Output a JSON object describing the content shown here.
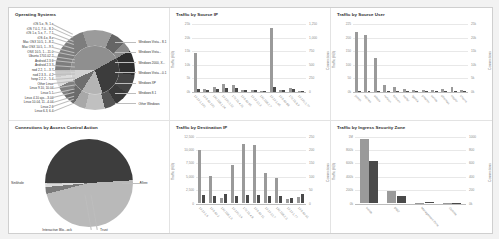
{
  "panels": {
    "operating_systems": {
      "title": "Operating Systems"
    },
    "traffic_source_ip": {
      "title": "Traffic by Source IP"
    },
    "traffic_source_user": {
      "title": "Traffic by Source User"
    },
    "connections_access_control": {
      "title": "Connections by Access Control Action"
    },
    "traffic_destination_ip": {
      "title": "Traffic by Destination IP"
    },
    "traffic_ingress_zone": {
      "title": "Traffic by Ingress Security Zone"
    }
  },
  "chart_data": [
    {
      "id": "operating_systems",
      "type": "pie",
      "title": "Operating Systems",
      "layout": "sunburst-two-ring",
      "legend": "callout-labels",
      "left_labels": [
        "iOS 5.x, 9i, 1.x",
        "iOS 7.0.1, 7.0... 8.1",
        "iOS 1.x, 5.x, 7... 7.1",
        "iOS 4.x, 8.x",
        "Mac OSX 10.5, 1...8.2",
        "Mac OSX 10.5, 1....9.5",
        "OSX 10.5, 1....11.0",
        "Ubuntu 1701.02.2",
        "Android 2.3.6",
        "Android 2.3.3",
        "nod 2.2, 1....3.7",
        "nod 2.3.3... 4.2",
        "hosp 2.2.2... 5.4",
        "Other Linux",
        "Linux 9.10, 10.04",
        "Linux 5.1",
        "Linux 4.10 ajo....3.04",
        "Linux 10.04, 11...4.04",
        "Linux 2.6",
        "Linux 6.3, 6.4"
      ],
      "right_labels": [
        "Windows Vista... 8.1",
        "Windows Vista...",
        "Windows 2000, X...",
        "Windows Vista....0.1",
        "Windows XP",
        "Windows 8.1",
        "Other Windows"
      ],
      "inner_ring": [
        {
          "name": "Windows",
          "value": 42,
          "color": "#8f8f8f"
        },
        {
          "name": "Linux",
          "value": 28,
          "color": "#3c3c3c"
        },
        {
          "name": "Mac OSX",
          "value": 14,
          "color": "#b4b4b4"
        },
        {
          "name": "Android",
          "value": 9,
          "color": "#6e6e6e"
        },
        {
          "name": "iOS",
          "value": 7,
          "color": "#d2d2d2"
        }
      ],
      "outer_ring": [
        {
          "name": "Windows Vista",
          "value": 20,
          "color": "#7d7d7d"
        },
        {
          "name": "Windows 7",
          "value": 12,
          "color": "#9b9b9b"
        },
        {
          "name": "Windows 2000",
          "value": 6,
          "color": "#656565"
        },
        {
          "name": "Windows XP",
          "value": 4,
          "color": "#8a8a8a"
        },
        {
          "name": "Linux 2.6",
          "value": 10,
          "color": "#2e2e2e"
        },
        {
          "name": "Linux 10.04",
          "value": 8,
          "color": "#444444"
        },
        {
          "name": "Linux 5.1",
          "value": 6,
          "color": "#3a3a3a"
        },
        {
          "name": "Other Linux",
          "value": 5,
          "color": "#555555"
        },
        {
          "name": "Mac OSX 10.5",
          "value": 8,
          "color": "#c0c0c0"
        },
        {
          "name": "Mac OSX 10.9",
          "value": 5,
          "color": "#a8a8a8"
        },
        {
          "name": "Android 2.3.3",
          "value": 5,
          "color": "#6b6b6b"
        },
        {
          "name": "Android 2.3.6",
          "value": 4,
          "color": "#808080"
        },
        {
          "name": "iOS 7.0.1",
          "value": 4,
          "color": "#dcdcdc"
        },
        {
          "name": "iOS 8.x",
          "value": 3,
          "color": "#cacaca"
        }
      ]
    },
    {
      "id": "traffic_source_ip",
      "type": "bar",
      "title": "Traffic by Source IP",
      "ylabel": "Traffic (KB)",
      "y2label": "Connections",
      "yticks": [
        "25k",
        "20k",
        "15k",
        "10k",
        "5k",
        "0k"
      ],
      "y2ticks": [
        "1,250",
        "1,000",
        "750",
        "500",
        "250",
        "0"
      ],
      "ylim": [
        0,
        25000
      ],
      "y2lim": [
        0,
        1250
      ],
      "grid": true,
      "categories": [
        "10.10.1.100",
        "10.5.60.100",
        "192.168.1.24",
        "10.100.0.12",
        "172.16.4.21",
        "10.5.60.55",
        "10.10.10.3",
        "192.168.2.7",
        "10.10.1.45",
        "10.5.60.88",
        "172.16.8.9",
        "10.100.0.77"
      ],
      "series": [
        {
          "name": "Traffic (KB)",
          "values": [
            14200,
            1100,
            1500,
            2600,
            2400,
            400,
            500,
            350,
            23500,
            600,
            1200,
            300
          ]
        },
        {
          "name": "Connections",
          "values": [
            40,
            30,
            55,
            70,
            60,
            20,
            25,
            18,
            90,
            25,
            45,
            15
          ]
        }
      ]
    },
    {
      "id": "traffic_source_user",
      "type": "bar",
      "title": "Traffic by Source User",
      "ylabel": "Traffic (KB)",
      "y2label": "Connections",
      "yticks": [
        "225",
        "200",
        "150",
        "100",
        "50",
        "0k"
      ],
      "y2ticks": [
        "25k",
        "20k",
        "15k",
        "10k",
        "5k",
        "0k"
      ],
      "ylim": [
        0,
        225
      ],
      "y2lim": [
        0,
        25000
      ],
      "grid": true,
      "categories": [
        "jsmith",
        "mjones",
        "adavis",
        "rwilson",
        "kbrown",
        "tmiller",
        "lgarcia",
        "pmartin",
        "swhite",
        "dthomas",
        "ctaylor",
        "bharris"
      ],
      "series": [
        {
          "name": "Traffic (KB)",
          "values": [
            196,
            188,
            112,
            22,
            16,
            8,
            6,
            6,
            6,
            8,
            14,
            6
          ]
        },
        {
          "name": "Connections",
          "values": [
            185,
            180,
            100,
            18,
            12,
            6,
            5,
            5,
            5,
            6,
            12,
            5
          ]
        }
      ]
    },
    {
      "id": "connections_access_control",
      "type": "pie",
      "title": "Connections by Access Control Action",
      "labels": [
        "Allow",
        "Sinkhole",
        "Interactive Blo...ock",
        "Trust"
      ],
      "slices": [
        {
          "name": "Allow",
          "value": 49.0,
          "color": "#3d3d3d"
        },
        {
          "name": "Sinkhole",
          "value": 47.0,
          "color": "#b9b9b9"
        },
        {
          "name": "Interactive Block",
          "value": 2.5,
          "color": "#7a7a7a"
        },
        {
          "name": "Trust",
          "value": 1.5,
          "color": "#dadada"
        }
      ]
    },
    {
      "id": "traffic_destination_ip",
      "type": "bar",
      "title": "Traffic by Destination IP",
      "ylabel": "Traffic (KB)",
      "y2label": "Connections",
      "yticks": [
        "12,500",
        "10,000",
        "7,500",
        "5,000",
        "2,500",
        "0"
      ],
      "y2ticks": [
        "250",
        "200",
        "150",
        "100",
        "50",
        "0"
      ],
      "ylim": [
        0,
        12500
      ],
      "y2lim": [
        0,
        250
      ],
      "grid": true,
      "categories": [
        "10.10.1.5",
        "10.5.60.2",
        "192.168.1.9",
        "10.100.0.4",
        "172.16.4.8",
        "10.5.60.11",
        "10.10.10.7",
        "192.168.2.3",
        "10.10.1.77",
        "10.5.60.91"
      ],
      "series": [
        {
          "name": "Traffic (KB)",
          "values": [
            9800,
            5000,
            900,
            7000,
            11000,
            10800,
            5600,
            4700,
            700,
            1200
          ]
        },
        {
          "name": "Connections",
          "values": [
            30,
            28,
            33,
            28,
            30,
            29,
            28,
            28,
            20,
            35
          ]
        }
      ]
    },
    {
      "id": "traffic_ingress_zone",
      "type": "bar",
      "title": "Traffic by Ingress Security Zone",
      "ylabel": "Traffic (KB)",
      "y2label": "Connections",
      "yticks": [
        "1M",
        "800k",
        "600k",
        "400k",
        "200k",
        "0k"
      ],
      "y2ticks": [
        "1000",
        "800",
        "600",
        "400",
        "200",
        "0k"
      ],
      "ylim": [
        0,
        1000000
      ],
      "y2lim": [
        0,
        1000
      ],
      "grid": true,
      "categories": [
        "Inside",
        "DMZ",
        "Management Zone",
        "Outside"
      ],
      "series": [
        {
          "name": "Traffic (KB)",
          "values": [
            960000,
            185000,
            4000,
            2000
          ]
        },
        {
          "name": "Connections",
          "values": [
            620,
            110,
            8,
            3
          ]
        }
      ]
    }
  ]
}
